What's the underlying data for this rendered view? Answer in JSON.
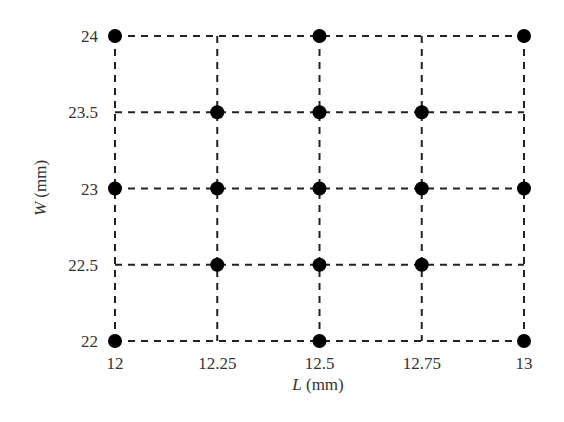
{
  "chart_data": {
    "type": "scatter",
    "title": "",
    "xlabel": "L (mm)",
    "ylabel": "W (mm)",
    "xlabel_var": "L",
    "ylabel_var": "W",
    "unit": "(mm)",
    "x_ticks": [
      "12",
      "12.25",
      "12.5",
      "12.75",
      "13"
    ],
    "y_ticks": [
      "22",
      "22.5",
      "23",
      "23.5",
      "24"
    ],
    "xlim": [
      12,
      13
    ],
    "ylim": [
      22,
      24
    ],
    "grid": "dashed",
    "legend": null,
    "points": [
      {
        "x": 12,
        "y": 24
      },
      {
        "x": 12.5,
        "y": 24
      },
      {
        "x": 13,
        "y": 24
      },
      {
        "x": 12.25,
        "y": 23.5
      },
      {
        "x": 12.5,
        "y": 23.5
      },
      {
        "x": 12.75,
        "y": 23.5
      },
      {
        "x": 12,
        "y": 23
      },
      {
        "x": 12.25,
        "y": 23
      },
      {
        "x": 12.5,
        "y": 23
      },
      {
        "x": 12.75,
        "y": 23
      },
      {
        "x": 13,
        "y": 23
      },
      {
        "x": 12.25,
        "y": 22.5
      },
      {
        "x": 12.5,
        "y": 22.5
      },
      {
        "x": 12.75,
        "y": 22.5
      },
      {
        "x": 12,
        "y": 22
      },
      {
        "x": 12.5,
        "y": 22
      },
      {
        "x": 13,
        "y": 22
      }
    ]
  }
}
